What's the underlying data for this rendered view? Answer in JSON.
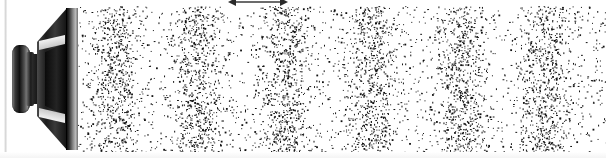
{
  "figure": {
    "title": "Loudspeaker emitting a longitudinal sound wave in air",
    "caption": "",
    "background_color": "#ffffff",
    "dot_color": "#111111",
    "speaker_color": "#1c1c1c"
  },
  "speaker": {
    "name": "loudspeaker-driver",
    "orientation": "side-view, facing right",
    "parts": [
      {
        "name": "magnet",
        "label": "magnet"
      },
      {
        "name": "voice-coil-neck",
        "label": "neck"
      },
      {
        "name": "cone",
        "label": "cone"
      },
      {
        "name": "front-flange",
        "label": "mounting flange"
      }
    ]
  },
  "annotation": {
    "arrow": {
      "name": "wavelength-arrow",
      "label": "",
      "type": "double-headed",
      "x_start": 228,
      "x_end": 288,
      "spans": "one wavelength"
    }
  },
  "chart_data": {
    "type": "scatter",
    "xlabel": "",
    "ylabel": "",
    "xlim": [
      78,
      606
    ],
    "ylim": [
      6,
      152
    ],
    "grid": false,
    "legend": null,
    "dot_count": 5200,
    "dot_radius_px": 1.0,
    "wavelength_px": 86,
    "compression_count": 6,
    "compression_centers_px": [
      115,
      198,
      285,
      370,
      460,
      545
    ],
    "band_half_width_px": 15,
    "density_contrast": 0.86,
    "baseline_density": 0.14,
    "rarefaction_centers_px": [
      157,
      242,
      327,
      415,
      502
    ],
    "series": [
      {
        "name": "compressions",
        "x": [
          115,
          198,
          285,
          370,
          460,
          545
        ],
        "values": [
          1.0,
          1.0,
          1.0,
          1.0,
          1.0,
          1.0
        ]
      },
      {
        "name": "rarefactions",
        "x": [
          157,
          242,
          327,
          415,
          502
        ],
        "values": [
          0.12,
          0.12,
          0.12,
          0.12,
          0.12
        ]
      }
    ]
  }
}
